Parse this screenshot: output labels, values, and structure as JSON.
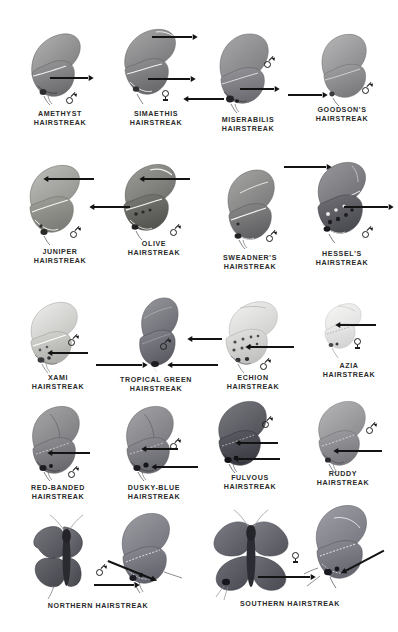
{
  "plate": {
    "title": "Hairstreak Butterflies Identification Plate",
    "background_color": "#ffffff",
    "ink_color": "#2a2a2a",
    "rows": 5,
    "specimen_count": 18
  },
  "symbols": {
    "male": "♂",
    "female": "♀"
  },
  "specimens": [
    {
      "id": "amethyst",
      "name": "AMETHYST\nHAIRSTREAK",
      "sex": "male",
      "view": "ventral-side",
      "tone": "#8e8e90",
      "arrow_count": 1
    },
    {
      "id": "simaethis",
      "name": "SIMAETHIS\nHAIRSTREAK",
      "sex": "female",
      "view": "ventral-side",
      "tone": "#8a8a8c",
      "arrow_count": 2
    },
    {
      "id": "miserabilis",
      "name": "MISERABILIS\nHAIRSTREAK",
      "sex": "male",
      "view": "ventral-side",
      "tone": "#8b8b8d",
      "arrow_count": 2
    },
    {
      "id": "goodsons",
      "name": "GOODSON'S\nHAIRSTREAK",
      "sex": "male",
      "view": "ventral-side",
      "tone": "#9c9c9e",
      "arrow_count": 1
    },
    {
      "id": "juniper",
      "name": "JUNIPER\nHAIRSTREAK",
      "sex": "male",
      "view": "ventral-side",
      "tone": "#9a9a98",
      "arrow_count": 1
    },
    {
      "id": "olive",
      "name": "OLIVE\nHAIRSTREAK",
      "sex": "male",
      "view": "ventral-side",
      "tone": "#77777a",
      "arrow_count": 2
    },
    {
      "id": "sweadners",
      "name": "SWEADNER'S\nHAIRSTREAK",
      "sex": "male",
      "view": "ventral-side",
      "tone": "#7f7f82",
      "arrow_count": 0
    },
    {
      "id": "hessels",
      "name": "HESSEL'S\nHAIRSTREAK",
      "sex": "male",
      "view": "ventral-side",
      "tone": "#6f6f72",
      "arrow_count": 2
    },
    {
      "id": "xami",
      "name": "XAMI\nHAIRSTREAK",
      "sex": "male",
      "view": "ventral-side",
      "tone": "#c9c9c7",
      "arrow_count": 1
    },
    {
      "id": "tropical-green",
      "name": "TROPICAL GREEN\nHAIRSTREAK",
      "sex": "male",
      "view": "ventral-side",
      "tone": "#74747a",
      "arrow_count": 2
    },
    {
      "id": "echion",
      "name": "ECHION\nHAIRSTREAK",
      "sex": "male",
      "view": "ventral-side",
      "tone": "#d8d8d6",
      "arrow_count": 2
    },
    {
      "id": "azia",
      "name": "AZIA\nHAIRSTREAK",
      "sex": "female",
      "view": "ventral-side",
      "tone": "#e2e2e0",
      "arrow_count": 1
    },
    {
      "id": "red-banded",
      "name": "RED-BANDED\nHAIRSTREAK",
      "sex": "male",
      "view": "ventral-side",
      "tone": "#8a8a8c",
      "arrow_count": 1
    },
    {
      "id": "dusky-blue",
      "name": "DUSKY-BLUE\nHAIRSTREAK",
      "sex": "male",
      "view": "ventral-side",
      "tone": "#8a8a8c",
      "arrow_count": 2
    },
    {
      "id": "fulvous",
      "name": "FULVOUS\nHAIRSTREAK",
      "sex": "male",
      "view": "ventral-side",
      "tone": "#5e5e62",
      "arrow_count": 2
    },
    {
      "id": "ruddy",
      "name": "RUDDY\nHAIRSTREAK",
      "sex": "male",
      "view": "ventral-side",
      "tone": "#9d9d9f",
      "arrow_count": 1
    },
    {
      "id": "northern",
      "name": "NORTHERN HAIRSTREAK",
      "sex": "male",
      "view": "dorsal-spread-and-ventral-side",
      "tone": "#63636a",
      "arrow_count": 2
    },
    {
      "id": "southern",
      "name": "SOUTHERN HAIRSTREAK",
      "sex": "female",
      "view": "dorsal-spread-and-ventral-side",
      "tone": "#6a6a70",
      "arrow_count": 2
    }
  ]
}
